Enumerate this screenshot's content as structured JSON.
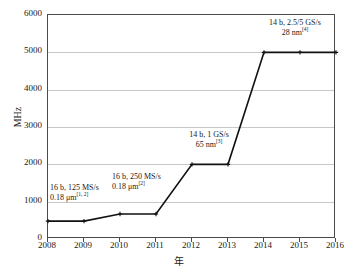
{
  "chart_data": {
    "type": "line",
    "title": "",
    "xlabel": "年",
    "ylabel": "MHz",
    "categories": [
      "2008",
      "2009",
      "2010",
      "2011",
      "2012",
      "2013",
      "2014",
      "2015",
      "2016"
    ],
    "x": [
      2008,
      2009,
      2010,
      2011,
      2012,
      2013,
      2014,
      2015,
      2016
    ],
    "values": [
      480,
      480,
      670,
      670,
      2000,
      2000,
      5000,
      5000,
      5000
    ],
    "series": [
      {
        "name": "",
        "values": [
          480,
          480,
          670,
          670,
          2000,
          2000,
          5000,
          5000,
          5000
        ]
      }
    ],
    "xlim": [
      2008,
      2016
    ],
    "ylim": [
      0,
      6000
    ],
    "yticks": [
      0,
      1000,
      2000,
      3000,
      4000,
      5000,
      6000
    ],
    "ytick_labels": [
      "0",
      "1000",
      "2000",
      "3000",
      "4000",
      "5000",
      "6000"
    ],
    "xtick_labels": [
      "2008",
      "2009",
      "2010",
      "2011",
      "2012",
      "2013",
      "2014",
      "2015",
      "2016"
    ],
    "grid": "horizontal",
    "legend": "none",
    "line_color": "#111111",
    "grid_color": "#c8c8c8",
    "axis_color": "#4a4a4a",
    "annotations": [
      {
        "id": "ann-0",
        "line1": "16 b, 125 MS/s",
        "line2": "0.18 μm",
        "ref": "[1, 2]",
        "anchor_year": 2008,
        "anchor_value": 480
      },
      {
        "id": "ann-1",
        "line1": "16 b, 250 MS/s",
        "line2": "0.18 μm",
        "ref": "[2]",
        "anchor_year": 2010,
        "anchor_value": 670
      },
      {
        "id": "ann-2",
        "line1": "14 b, 1 GS/s",
        "line2": "65 nm",
        "ref": "[3]",
        "anchor_year": 2012,
        "anchor_value": 2000
      },
      {
        "id": "ann-3",
        "line1": "14 b, 2.5/5 GS/s",
        "line2": "28 nm",
        "ref": "[4]",
        "anchor_year": 2014,
        "anchor_value": 5000
      }
    ]
  }
}
